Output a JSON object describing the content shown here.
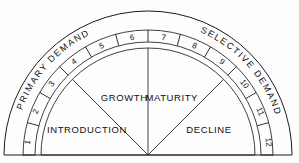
{
  "diagram": {
    "background_color": "#fdfdfd",
    "line_color": "#1b1b1b",
    "center": {
      "x": 148,
      "y": 155
    },
    "radii": {
      "outer": 144,
      "band_outer": 125,
      "band_inner": 113,
      "inner": 107
    },
    "demand_bands": [
      {
        "key": "primary",
        "label": "PRIMARY DEMAND",
        "side": "left"
      },
      {
        "key": "selective",
        "label": "SELECTIVE DEMAND",
        "side": "right"
      }
    ],
    "scale": {
      "label": "stage-scale",
      "ticks": [
        "1",
        "2",
        "3",
        "4",
        "5",
        "6",
        "7",
        "8",
        "9",
        "10",
        "11",
        "12"
      ]
    },
    "sectors": [
      {
        "key": "introduction",
        "label": "INTRODUCTION",
        "start_deg": 180,
        "end_deg": 135
      },
      {
        "key": "growth",
        "label": "GROWTH",
        "start_deg": 135,
        "end_deg": 90
      },
      {
        "key": "maturity",
        "label": "MATURITY",
        "start_deg": 90,
        "end_deg": 45
      },
      {
        "key": "decline",
        "label": "DECLINE",
        "start_deg": 45,
        "end_deg": 0
      }
    ],
    "baseline": {
      "label": "baseline",
      "y": 155
    }
  }
}
